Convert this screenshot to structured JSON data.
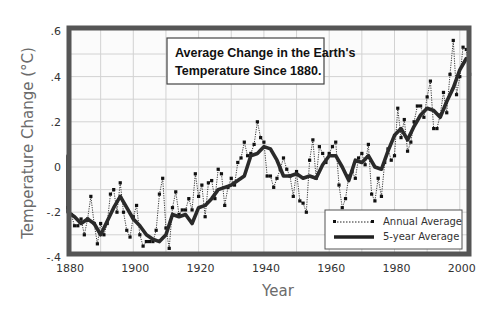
{
  "chart_data": {
    "type": "line",
    "title": "Average Change in the Earth's Temperature Since 1880.",
    "title_lines": [
      "Average Change in the Earth's",
      "Temperature Since 1880."
    ],
    "xlabel": "Year",
    "ylabel": "Temperature Change (°C)",
    "xlim": [
      1880,
      2004
    ],
    "ylim": [
      -0.4,
      0.6
    ],
    "xticks": [
      1880,
      1900,
      1920,
      1940,
      1960,
      1980,
      2000
    ],
    "xtick_labels": [
      "1880",
      "1900",
      "1920",
      "1940",
      "1960",
      "1980",
      "2000"
    ],
    "yticks": [
      0.6,
      0.4,
      0.2,
      0,
      -0.2,
      -0.4
    ],
    "ytick_labels": [
      ".6",
      ".4",
      ".2",
      "0",
      "-.2",
      "-.4"
    ],
    "grid": true,
    "legend_position": "lower right",
    "legend": [
      "Annual Average",
      "5-year Average"
    ],
    "series": [
      {
        "name": "Annual Average",
        "style": "dotted line with square markers",
        "x": [
          1880,
          1881,
          1882,
          1883,
          1884,
          1885,
          1886,
          1887,
          1888,
          1889,
          1890,
          1891,
          1892,
          1893,
          1894,
          1895,
          1896,
          1897,
          1898,
          1899,
          1900,
          1901,
          1902,
          1903,
          1904,
          1905,
          1906,
          1907,
          1908,
          1909,
          1910,
          1911,
          1912,
          1913,
          1914,
          1915,
          1916,
          1917,
          1918,
          1919,
          1920,
          1921,
          1922,
          1923,
          1924,
          1925,
          1926,
          1927,
          1928,
          1929,
          1930,
          1931,
          1932,
          1933,
          1934,
          1935,
          1936,
          1937,
          1938,
          1939,
          1940,
          1941,
          1942,
          1943,
          1944,
          1945,
          1946,
          1947,
          1948,
          1949,
          1950,
          1951,
          1952,
          1953,
          1954,
          1955,
          1956,
          1957,
          1958,
          1959,
          1960,
          1961,
          1962,
          1963,
          1964,
          1965,
          1966,
          1967,
          1968,
          1969,
          1970,
          1971,
          1972,
          1973,
          1974,
          1975,
          1976,
          1977,
          1978,
          1979,
          1980,
          1981,
          1982,
          1983,
          1984,
          1985,
          1986,
          1987,
          1988,
          1989,
          1990,
          1991,
          1992,
          1993,
          1994,
          1995,
          1996,
          1997,
          1998,
          1999,
          2000,
          2001,
          2002,
          2003
        ],
        "values": [
          -0.18,
          -0.21,
          -0.26,
          -0.26,
          -0.23,
          -0.3,
          -0.23,
          -0.13,
          -0.25,
          -0.34,
          -0.25,
          -0.3,
          -0.25,
          -0.12,
          -0.1,
          -0.2,
          -0.07,
          -0.2,
          -0.28,
          -0.31,
          -0.22,
          -0.17,
          -0.3,
          -0.35,
          -0.33,
          -0.33,
          -0.33,
          -0.28,
          -0.12,
          -0.05,
          -0.27,
          -0.36,
          -0.18,
          -0.11,
          -0.21,
          -0.19,
          -0.19,
          -0.14,
          -0.19,
          -0.03,
          -0.13,
          -0.08,
          -0.22,
          -0.07,
          -0.06,
          -0.14,
          -0.01,
          -0.03,
          -0.17,
          -0.09,
          -0.05,
          -0.08,
          0.02,
          0.04,
          0.11,
          0.05,
          0.06,
          0.1,
          0.2,
          0.13,
          0.11,
          -0.04,
          -0.04,
          -0.09,
          -0.05,
          -0.01,
          0.04,
          -0.01,
          -0.04,
          -0.13,
          -0.02,
          -0.15,
          -0.16,
          -0.2,
          0.03,
          0.12,
          -0.05,
          0.09,
          0.06,
          0.02,
          0.06,
          0.09,
          0.11,
          -0.08,
          -0.18,
          -0.14,
          -0.04,
          -0.02,
          -0.05,
          0.04,
          0.06,
          0.01,
          0.1,
          -0.12,
          -0.15,
          -0.05,
          -0.13,
          0.02,
          0.08,
          0.03,
          0.05,
          0.26,
          0.13,
          0.21,
          0.07,
          0.11,
          0.2,
          0.27,
          0.27,
          0.22,
          0.31,
          0.38,
          0.17,
          0.17,
          0.23,
          0.33,
          0.24,
          0.41,
          0.56,
          0.32,
          0.4,
          0.53,
          0.52,
          0.41
        ]
      },
      {
        "name": "5-year Average",
        "style": "thick solid line",
        "x": [
          1880,
          1882,
          1884,
          1886,
          1888,
          1890,
          1892,
          1894,
          1896,
          1898,
          1900,
          1902,
          1904,
          1906,
          1908,
          1910,
          1912,
          1914,
          1916,
          1918,
          1920,
          1922,
          1924,
          1926,
          1928,
          1930,
          1932,
          1934,
          1936,
          1938,
          1940,
          1942,
          1944,
          1946,
          1948,
          1950,
          1952,
          1954,
          1956,
          1958,
          1960,
          1962,
          1964,
          1966,
          1968,
          1970,
          1972,
          1974,
          1976,
          1978,
          1980,
          1982,
          1984,
          1986,
          1988,
          1990,
          1992,
          1994,
          1996,
          1998,
          2000,
          2002
        ],
        "values": [
          -0.2,
          -0.22,
          -0.25,
          -0.23,
          -0.25,
          -0.3,
          -0.24,
          -0.18,
          -0.13,
          -0.18,
          -0.23,
          -0.26,
          -0.3,
          -0.32,
          -0.33,
          -0.3,
          -0.21,
          -0.22,
          -0.21,
          -0.25,
          -0.18,
          -0.17,
          -0.14,
          -0.1,
          -0.09,
          -0.08,
          -0.06,
          -0.04,
          0.05,
          0.06,
          0.09,
          0.08,
          0.03,
          -0.04,
          -0.04,
          -0.03,
          -0.05,
          -0.04,
          -0.05,
          0.01,
          0.05,
          0.05,
          0.0,
          -0.06,
          0.03,
          0.02,
          0.05,
          0.0,
          -0.01,
          0.07,
          0.14,
          0.17,
          0.12,
          0.18,
          0.23,
          0.26,
          0.25,
          0.22,
          0.29,
          0.35,
          0.43,
          0.48
        ]
      }
    ]
  }
}
